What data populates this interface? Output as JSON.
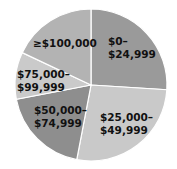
{
  "chart_data": {
    "type": "pie",
    "title": "",
    "categories": [
      "$0–$24,999",
      "$25,000–$49,999",
      "$50,000–$74,999",
      "$75,000–$99,999",
      "≥$100,000"
    ],
    "values": [
      26,
      27,
      19,
      10,
      18
    ],
    "unit": "percent (estimated from slice angles)",
    "colors": [
      "#9a9a9a",
      "#c9c9c9",
      "#8e8e8e",
      "#cacaca",
      "#b3b3b3"
    ],
    "start_angle_deg_clockwise_from_top": 0,
    "legend": "none (labels inside slices)",
    "labels": [
      {
        "line1": "$0–",
        "line2": "$24,999"
      },
      {
        "line1": "$25,000–",
        "line2": "$49,999"
      },
      {
        "line1": "$50,000–",
        "line2": "$74,999"
      },
      {
        "line1": "$75,000–",
        "line2": "$99,999"
      },
      {
        "line1": "≥$100,000",
        "line2": ""
      }
    ]
  }
}
